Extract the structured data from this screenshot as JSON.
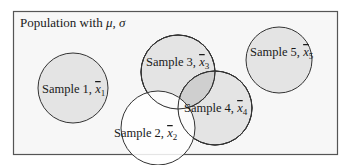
{
  "population": {
    "label": "Population with ",
    "mu": "μ",
    "sep": ", ",
    "sigma": "σ"
  },
  "samples": [
    {
      "name": "Sample 1, ",
      "xbar": "x",
      "sub": "1",
      "cx": 73,
      "cy": 88,
      "r": 35,
      "fill": "#e4e4e4"
    },
    {
      "name": "Sample 3, ",
      "xbar": "x",
      "sub": "3",
      "cx": 178,
      "cy": 72,
      "r": 37,
      "fill": "#e4e4e4"
    },
    {
      "name": "Sample 4, ",
      "xbar": "x",
      "sub": "4",
      "cx": 215,
      "cy": 108,
      "r": 37,
      "fill": "#e4e4e4"
    },
    {
      "name": "Sample 2, ",
      "xbar": "x",
      "sub": "2",
      "cx": 158,
      "cy": 128,
      "r": 37,
      "fill": "#ffffff"
    },
    {
      "name": "Sample 5, ",
      "xbar": "x",
      "sub": "5",
      "cx": 279,
      "cy": 60,
      "r": 33,
      "fill": "#e4e4e4"
    }
  ],
  "colors": {
    "border": "#555555",
    "box_fill": "#f7f7f7",
    "circle_fill": "#e4e4e4",
    "overlap_fill": "#cfcfcf",
    "stroke": "#333333"
  }
}
